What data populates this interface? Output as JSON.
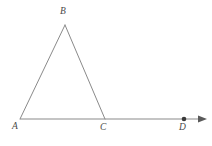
{
  "figure": {
    "kind": "geometry-diagram",
    "background_color": "#ffffff",
    "stroke_color": "#8a8a8a",
    "label_color": "#4a4a4a",
    "stroke_width": 1,
    "canvas": {
      "width": 212,
      "height": 146
    },
    "points": [
      {
        "name": "A",
        "label": "A",
        "x": 20,
        "y": 119,
        "label_x": 12,
        "label_y": 122,
        "marked": false
      },
      {
        "name": "B",
        "label": "B",
        "x": 65,
        "y": 25,
        "label_x": 60,
        "label_y": 7,
        "marked": false
      },
      {
        "name": "C",
        "label": "C",
        "x": 105,
        "y": 119,
        "label_x": 100,
        "label_y": 123,
        "marked": false
      },
      {
        "name": "D",
        "label": "D",
        "x": 184,
        "y": 119,
        "label_x": 179,
        "label_y": 123,
        "marked": true
      }
    ],
    "segments": [
      {
        "name": "AB",
        "from": "A",
        "to": "B",
        "x1": 20,
        "y1": 119,
        "x2": 65,
        "y2": 25
      },
      {
        "name": "BC",
        "from": "B",
        "to": "C",
        "x1": 65,
        "y1": 25,
        "x2": 105,
        "y2": 119
      },
      {
        "name": "AD",
        "from": "A",
        "to": "D",
        "x1": 20,
        "y1": 119,
        "x2": 198,
        "y2": 119
      }
    ],
    "ray": {
      "name": "ray-AD",
      "start_x": 20,
      "start_y": 119,
      "end_x": 198,
      "end_y": 119,
      "arrow_tip_x": 207,
      "arrow_tip_y": 119,
      "arrow_half_height": 3.6,
      "arrow_length": 9
    },
    "point_marker": {
      "name": "point-D-dot",
      "cx": 184,
      "cy": 119,
      "r": 2.3
    }
  }
}
